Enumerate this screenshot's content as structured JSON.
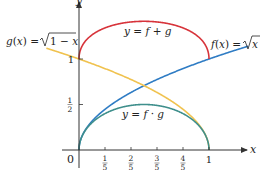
{
  "chart_data": {
    "type": "line",
    "title": "",
    "xlabel": "x",
    "ylabel": "y",
    "xlim": [
      0,
      1.3
    ],
    "ylim": [
      0,
      1.45
    ],
    "x_ticks": [
      {
        "value": 0.2,
        "num": "1",
        "den": "5"
      },
      {
        "value": 0.4,
        "num": "2",
        "den": "5"
      },
      {
        "value": 0.6,
        "num": "3",
        "den": "5"
      },
      {
        "value": 0.8,
        "num": "4",
        "den": "5"
      },
      {
        "value": 1.0,
        "label": "1"
      }
    ],
    "y_ticks": [
      {
        "value": 0.5,
        "num": "1",
        "den": "2"
      },
      {
        "value": 1.0,
        "label": "1"
      }
    ],
    "origin_label": "0",
    "series": [
      {
        "name": "f(x) = √x",
        "func": "sqrt(x)",
        "domain": [
          0,
          1.3
        ],
        "color": "#2f7cc4"
      },
      {
        "name": "g(x) = √(1 − x)",
        "func": "sqrt(1-x)",
        "domain": [
          -0.25,
          1
        ],
        "color": "#f0c24e"
      },
      {
        "name": "y = f + g",
        "func": "sqrt(x)+sqrt(1-x)",
        "domain": [
          0,
          1
        ],
        "color": "#d7333a"
      },
      {
        "name": "y = f · g",
        "func": "sqrt(x)*sqrt(1-x)",
        "domain": [
          0,
          1
        ],
        "color": "#3f8f8c"
      }
    ],
    "annotations": {
      "g_label": "g(x) = √1 − x",
      "f_label": "f(x) = √x",
      "sum_label": "y = f + g",
      "prod_label": "y = f · g"
    }
  }
}
